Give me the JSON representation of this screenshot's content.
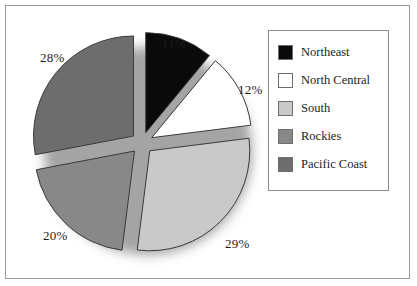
{
  "figure": {
    "background": "#ffffff",
    "frame_color": "#9a9a9a"
  },
  "chart_data": {
    "type": "pie",
    "title": "",
    "categories": [
      "Northeast",
      "North Central",
      "South",
      "Rockies",
      "Pacific Coast"
    ],
    "values": [
      11,
      12,
      29,
      20,
      28
    ],
    "value_labels": [
      "11%",
      "12%",
      "29%",
      "20%",
      "28%"
    ],
    "colors": [
      "#0a0a0a",
      "#ffffff",
      "#c9c9c9",
      "#888888",
      "#6d6d6d"
    ],
    "units": "percent",
    "exploded": true,
    "start_angle_deg": 0,
    "direction": "clockwise",
    "legend": {
      "position": "right",
      "border_color": "#8d8d8d",
      "entries": [
        {
          "label": "Northeast",
          "color": "#0a0a0a"
        },
        {
          "label": "North Central",
          "color": "#ffffff"
        },
        {
          "label": "South",
          "color": "#c9c9c9"
        },
        {
          "label": "Rockies",
          "color": "#888888"
        },
        {
          "label": "Pacific Coast",
          "color": "#6d6d6d"
        }
      ]
    },
    "shadow": true,
    "grid": false,
    "xlabel": "",
    "ylabel": ""
  }
}
